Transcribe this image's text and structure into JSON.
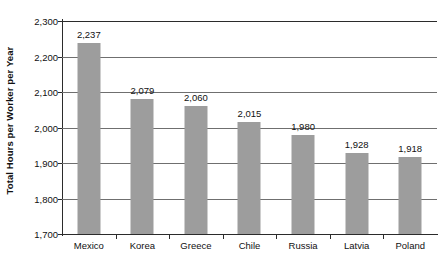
{
  "chart_data": {
    "type": "bar",
    "title": "",
    "subtitle": "",
    "xlabel": "",
    "ylabel": "Total Hours per Worker per Year",
    "categories": [
      "Mexico",
      "Korea",
      "Greece",
      "Chile",
      "Russia",
      "Latvia",
      "Poland"
    ],
    "values": [
      2237,
      2079,
      2060,
      2015,
      1980,
      1928,
      1918
    ],
    "value_labels": [
      "2,237",
      "2,079",
      "2,060",
      "2,015",
      "1,980",
      "1,928",
      "1,918"
    ],
    "ylim": [
      1700,
      2300
    ],
    "ytick_values": [
      2300,
      2200,
      2100,
      2000,
      1900,
      1800,
      1700
    ],
    "ytick_labels": [
      "2,300",
      "2,200",
      "2,100",
      "2,000",
      "1,900",
      "1,800",
      "1,700"
    ],
    "grid": "horizontal",
    "legend": "none",
    "bar_color": "#9d9d9d",
    "axis_color": "#2b2b2b",
    "gridline_color": "#6f6f6f",
    "background_color": "#ffffff",
    "text_color": "#111111",
    "series": [
      {
        "name": "Total hours per worker per year",
        "values": [
          2237,
          2079,
          2060,
          2015,
          1980,
          1928,
          1918
        ]
      }
    ]
  }
}
